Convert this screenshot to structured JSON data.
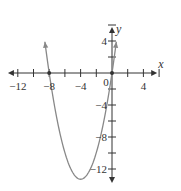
{
  "chart_data": {
    "type": "line",
    "title": "",
    "xlabel": "x",
    "ylabel": "y",
    "xlim": [
      -13,
      5.5
    ],
    "ylim": [
      -13.5,
      5.5
    ],
    "x_ticks": [
      -12,
      -10,
      -8,
      -6,
      -4,
      -2,
      2,
      4,
      6
    ],
    "y_ticks": [
      6,
      4,
      2,
      -2,
      -4,
      -6,
      -8,
      -10,
      -12
    ],
    "x_tick_labels": [
      {
        "value": -12,
        "label": "−12"
      },
      {
        "value": -8,
        "label": "−8"
      },
      {
        "value": -4,
        "label": "−4"
      },
      {
        "value": 4,
        "label": "4"
      }
    ],
    "y_tick_labels": [
      {
        "value": 4,
        "label": "4"
      },
      {
        "value": -4,
        "label": "−4"
      },
      {
        "value": -8,
        "label": "−8"
      },
      {
        "value": -12,
        "label": "−12"
      }
    ],
    "origin_label": "0",
    "grid": false,
    "series": [
      {
        "name": "parabola",
        "function": "y = 0.83 x (x + 8)",
        "x_range": [
          -8.55,
          0.55
        ],
        "roots": [
          -8,
          0
        ],
        "vertex": [
          -4,
          -13.3
        ],
        "arrows_at_ends": true,
        "color": "#888888"
      }
    ],
    "marked_points": [
      {
        "x": -8,
        "y": 0
      },
      {
        "x": 0,
        "y": 0
      }
    ]
  }
}
